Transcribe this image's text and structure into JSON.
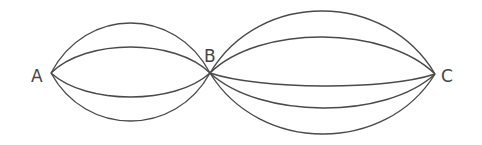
{
  "diagram": {
    "type": "multigraph",
    "nodes": [
      {
        "id": "A",
        "label": "A",
        "x": 51,
        "y": 73,
        "label_x": 31,
        "label_y": 82
      },
      {
        "id": "B",
        "label": "B",
        "x": 210,
        "y": 73,
        "label_x": 204,
        "label_y": 62
      },
      {
        "id": "C",
        "label": "C",
        "x": 435,
        "y": 74,
        "label_x": 441,
        "label_y": 82
      }
    ],
    "edges_AB": [
      {
        "from": "A",
        "to": "B",
        "peak_y": 23
      },
      {
        "from": "A",
        "to": "B",
        "peak_y": 47
      },
      {
        "from": "A",
        "to": "B",
        "peak_y": 97
      },
      {
        "from": "A",
        "to": "B",
        "peak_y": 121
      }
    ],
    "edges_BC": [
      {
        "from": "B",
        "to": "C",
        "peak_y": 11
      },
      {
        "from": "B",
        "to": "C",
        "peak_y": 37
      },
      {
        "from": "B",
        "to": "C",
        "peak_y": 86
      },
      {
        "from": "B",
        "to": "C",
        "peak_y": 108
      },
      {
        "from": "B",
        "to": "C",
        "peak_y": 134
      }
    ]
  }
}
